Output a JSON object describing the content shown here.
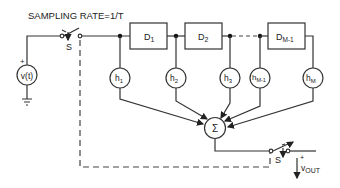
{
  "diagram": {
    "title": "SAMPLING RATE=1/T",
    "source": {
      "label": "v(t)",
      "polarity": "+"
    },
    "input_switch": {
      "label": "S"
    },
    "output_switch": {
      "label": "S"
    },
    "delays": [
      {
        "label": "D",
        "sub": "1"
      },
      {
        "label": "D",
        "sub": "2"
      },
      {
        "label": "D",
        "sub": "M-1"
      }
    ],
    "taps": [
      {
        "label": "h",
        "sub": "1"
      },
      {
        "label": "h",
        "sub": "2"
      },
      {
        "label": "h",
        "sub": "3"
      },
      {
        "label": "h",
        "sub": "M-1"
      },
      {
        "label": "h",
        "sub": "M"
      }
    ],
    "summer": {
      "label": "Σ"
    },
    "output": {
      "label": "v",
      "sub": "OUT",
      "polarity": "+"
    }
  }
}
